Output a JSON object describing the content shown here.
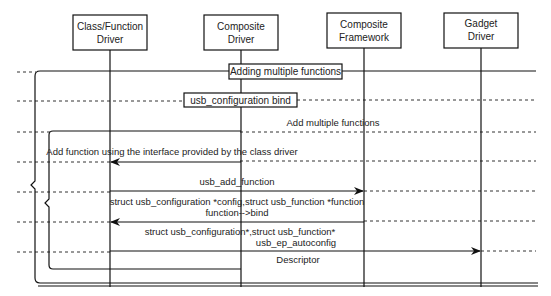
{
  "diagram": {
    "type": "sequence-diagram",
    "actors": [
      {
        "id": "class_function_driver",
        "line1": "Class/Function",
        "line2": "Driver"
      },
      {
        "id": "composite_driver",
        "line1": "Composite",
        "line2": "Driver"
      },
      {
        "id": "composite_framework",
        "line1": "Composite",
        "line2": "Framework"
      },
      {
        "id": "gadget_driver",
        "line1": "Gadget",
        "line2": "Driver"
      }
    ],
    "frames": {
      "outer": {
        "label": "Adding multiple functions"
      },
      "bind": {
        "label": "usb_configuration bind"
      },
      "inner": {
        "label": "Add multiple functions"
      }
    },
    "messages": [
      {
        "from": "composite_driver",
        "to": "class_function_driver",
        "text": "Add function using the interface provided by the class driver"
      },
      {
        "from": "class_function_driver",
        "to": "composite_framework",
        "text": "usb_add_function"
      },
      {
        "from": "composite_framework",
        "to": "class_function_driver",
        "line1": "struct usb_configuration *config,struct usb_function *function",
        "line2": "function-->bind"
      },
      {
        "from": "class_function_driver",
        "to": "gadget_driver",
        "line1": "struct usb_configuration*,struct usb_function*",
        "line2": "usb_ep_autoconfig"
      },
      {
        "from": "class_function_driver",
        "to": "composite_driver",
        "text": "Descriptor"
      }
    ]
  }
}
